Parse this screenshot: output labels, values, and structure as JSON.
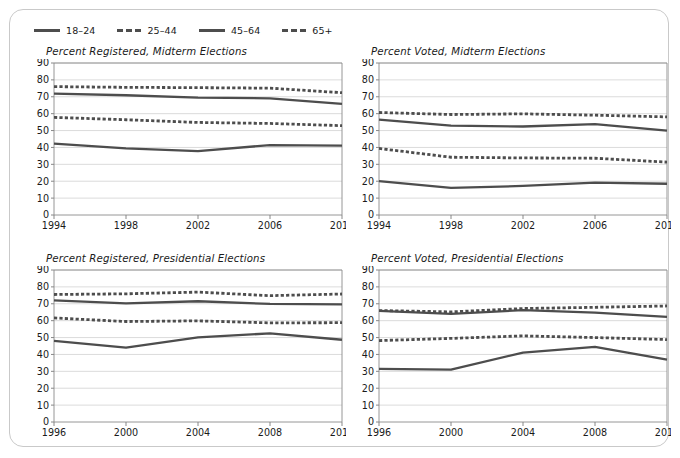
{
  "figure": {
    "legend": {
      "name": "age-group-legend",
      "items": [
        {
          "label": "18–24",
          "style": "solid-thick",
          "color": "#4d4d4d"
        },
        {
          "label": "25–44",
          "style": "dashed",
          "color": "#4d4d4d"
        },
        {
          "label": "45–64",
          "style": "solid-thick",
          "color": "#4d4d4d"
        },
        {
          "label": "65+",
          "style": "dashed",
          "color": "#4d4d4d"
        }
      ]
    }
  },
  "chart_data": [
    {
      "panel": "top-left",
      "type": "line",
      "title": "Percent Registered, Midterm Elections",
      "xlabel": "",
      "ylabel": "",
      "x": [
        1994,
        1998,
        2002,
        2006,
        2010
      ],
      "categories": [
        "1994",
        "1998",
        "2002",
        "2006",
        "2010"
      ],
      "xlim": [
        1994,
        2010
      ],
      "ylim": [
        0,
        90
      ],
      "yticks": [
        0,
        10,
        20,
        30,
        40,
        50,
        60,
        70,
        80,
        90
      ],
      "grid": true,
      "legend_position": "figure-top-left",
      "series": [
        {
          "name": "18–24",
          "style": "solid",
          "color": "#4d4d4d",
          "values": [
            42.3,
            39.4,
            37.8,
            41.4,
            41.1
          ]
        },
        {
          "name": "25–44",
          "style": "dashed",
          "color": "#4d4d4d",
          "values": [
            57.8,
            56.4,
            54.8,
            54.2,
            52.9
          ]
        },
        {
          "name": "45–64",
          "style": "solid",
          "color": "#4d4d4d",
          "values": [
            71.9,
            70.9,
            69.5,
            69.1,
            65.8
          ]
        },
        {
          "name": "65+",
          "style": "dashed",
          "color": "#4d4d4d",
          "values": [
            76.0,
            75.6,
            75.4,
            75.1,
            72.4
          ]
        }
      ]
    },
    {
      "panel": "top-right",
      "type": "line",
      "title": "Percent Voted, Midterm Elections",
      "xlabel": "",
      "ylabel": "",
      "x": [
        1994,
        1998,
        2002,
        2006,
        2010
      ],
      "categories": [
        "1994",
        "1998",
        "2002",
        "2006",
        "2010"
      ],
      "xlim": [
        1994,
        2010
      ],
      "ylim": [
        0,
        90
      ],
      "yticks": [
        0,
        10,
        20,
        30,
        40,
        50,
        60,
        70,
        80,
        90
      ],
      "grid": true,
      "legend_position": "figure-top-left",
      "series": [
        {
          "name": "18–24",
          "style": "solid",
          "color": "#4d4d4d",
          "values": [
            20.1,
            16.1,
            17.2,
            19.2,
            18.5
          ]
        },
        {
          "name": "25–44",
          "style": "dashed",
          "color": "#4d4d4d",
          "values": [
            39.4,
            34.2,
            33.8,
            33.6,
            31.3
          ]
        },
        {
          "name": "45–64",
          "style": "solid",
          "color": "#4d4d4d",
          "values": [
            56.5,
            52.9,
            52.4,
            53.8,
            49.9
          ]
        },
        {
          "name": "65+",
          "style": "dashed",
          "color": "#4d4d4d",
          "values": [
            60.7,
            59.5,
            59.9,
            59.1,
            58.1
          ]
        }
      ]
    },
    {
      "panel": "bottom-left",
      "type": "line",
      "title": "Percent Registered, Presidential Elections",
      "xlabel": "",
      "ylabel": "",
      "x": [
        1996,
        2000,
        2004,
        2008,
        2012
      ],
      "categories": [
        "1996",
        "2000",
        "2004",
        "2008",
        "2012"
      ],
      "xlim": [
        1996,
        2012
      ],
      "ylim": [
        0,
        90
      ],
      "yticks": [
        0,
        10,
        20,
        30,
        40,
        50,
        60,
        70,
        80,
        90
      ],
      "grid": true,
      "legend_position": "figure-top-left",
      "series": [
        {
          "name": "18–24",
          "style": "solid",
          "color": "#4d4d4d",
          "values": [
            48.0,
            44.0,
            50.1,
            52.5,
            48.7
          ]
        },
        {
          "name": "25–44",
          "style": "dashed",
          "color": "#4d4d4d",
          "values": [
            61.6,
            59.5,
            59.9,
            58.7,
            58.8
          ]
        },
        {
          "name": "45–64",
          "style": "solid",
          "color": "#4d4d4d",
          "values": [
            72.0,
            70.2,
            71.5,
            69.9,
            69.6
          ]
        },
        {
          "name": "65+",
          "style": "dashed",
          "color": "#4d4d4d",
          "values": [
            75.5,
            75.9,
            76.9,
            74.8,
            75.8
          ]
        }
      ]
    },
    {
      "panel": "bottom-right",
      "type": "line",
      "title": "Percent Voted, Presidential Elections",
      "xlabel": "",
      "ylabel": "",
      "x": [
        1996,
        2000,
        2004,
        2008,
        2012
      ],
      "categories": [
        "1996",
        "2000",
        "2004",
        "2008",
        "2012"
      ],
      "xlim": [
        1996,
        2012
      ],
      "ylim": [
        0,
        90
      ],
      "yticks": [
        0,
        10,
        20,
        30,
        40,
        50,
        60,
        70,
        80,
        90
      ],
      "grid": true,
      "legend_position": "figure-top-left",
      "series": [
        {
          "name": "18–24",
          "style": "solid",
          "color": "#4d4d4d",
          "values": [
            31.4,
            31.0,
            41.1,
            44.5,
            37.0
          ]
        },
        {
          "name": "25–44",
          "style": "dashed",
          "color": "#4d4d4d",
          "values": [
            48.2,
            49.5,
            51.0,
            50.0,
            48.8
          ]
        },
        {
          "name": "45–64",
          "style": "solid",
          "color": "#4d4d4d",
          "values": [
            65.8,
            64.0,
            66.2,
            64.8,
            62.3
          ]
        },
        {
          "name": "65+",
          "style": "dashed",
          "color": "#4d4d4d",
          "values": [
            66.0,
            65.2,
            67.2,
            67.9,
            68.7
          ]
        }
      ]
    }
  ]
}
